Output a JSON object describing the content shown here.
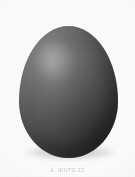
{
  "figure": {
    "caption": "A. IKUTO 22",
    "background_color": "#fdfdfd",
    "egg": {
      "highlight_color": "#8d8d8d",
      "midtone_color": "#5e5e5e",
      "shadow_color": "#3a3a3a",
      "light_direction": "upper-left",
      "shadow_color_ground": "#000000"
    }
  }
}
